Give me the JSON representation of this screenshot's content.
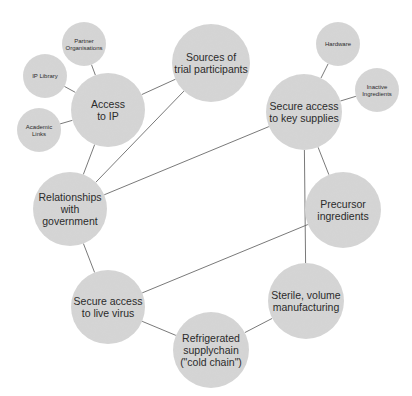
{
  "diagram": {
    "colors": {
      "background": "#ffffff",
      "node_fill": "#d6d6d6",
      "edge": "#6a6a6a",
      "text": "#2b2b2b"
    },
    "nodes": [
      {
        "id": "access-to-ip",
        "label": [
          "Access",
          "to IP"
        ],
        "size": "large"
      },
      {
        "id": "sources-of-trial-participants",
        "label": [
          "Sources of",
          "trial participants"
        ],
        "size": "large"
      },
      {
        "id": "relationships-with-government",
        "label": [
          "Relationships",
          "with",
          "government"
        ],
        "size": "large"
      },
      {
        "id": "secure-access-to-key-supplies",
        "label": [
          "Secure access",
          "to key supplies"
        ],
        "size": "large"
      },
      {
        "id": "precursor-ingredients",
        "label": [
          "Precursor",
          "ingredients"
        ],
        "size": "large"
      },
      {
        "id": "sterile-volume-manufacturing",
        "label": [
          "Sterile, volume",
          "manufacturing"
        ],
        "size": "large"
      },
      {
        "id": "secure-access-to-live-virus",
        "label": [
          "Secure access",
          "to live virus"
        ],
        "size": "large"
      },
      {
        "id": "refrigerated-supplychain",
        "label": [
          "Refrigerated",
          "supplychain",
          "(\"cold chain\")"
        ],
        "size": "large"
      },
      {
        "id": "partner-organisations",
        "label": [
          "Partner",
          "Organisations"
        ],
        "size": "small"
      },
      {
        "id": "ip-library",
        "label": [
          "IP Library"
        ],
        "size": "small"
      },
      {
        "id": "academic-links",
        "label": [
          "Academic",
          "Links"
        ],
        "size": "small"
      },
      {
        "id": "hardware",
        "label": [
          "Hardware"
        ],
        "size": "small"
      },
      {
        "id": "inactive-ingredients",
        "label": [
          "Inactive",
          "Ingredients"
        ],
        "size": "small"
      }
    ],
    "edges": [
      [
        "partner-organisations",
        "access-to-ip"
      ],
      [
        "ip-library",
        "access-to-ip"
      ],
      [
        "academic-links",
        "access-to-ip"
      ],
      [
        "access-to-ip",
        "sources-of-trial-participants"
      ],
      [
        "access-to-ip",
        "relationships-with-government"
      ],
      [
        "relationships-with-government",
        "sources-of-trial-participants"
      ],
      [
        "relationships-with-government",
        "secure-access-to-key-supplies"
      ],
      [
        "relationships-with-government",
        "secure-access-to-live-virus"
      ],
      [
        "hardware",
        "secure-access-to-key-supplies"
      ],
      [
        "inactive-ingredients",
        "secure-access-to-key-supplies"
      ],
      [
        "secure-access-to-key-supplies",
        "precursor-ingredients"
      ],
      [
        "secure-access-to-key-supplies",
        "sterile-volume-manufacturing"
      ],
      [
        "secure-access-to-live-virus",
        "precursor-ingredients"
      ],
      [
        "secure-access-to-live-virus",
        "refrigerated-supplychain"
      ],
      [
        "refrigerated-supplychain",
        "sterile-volume-manufacturing"
      ]
    ]
  }
}
